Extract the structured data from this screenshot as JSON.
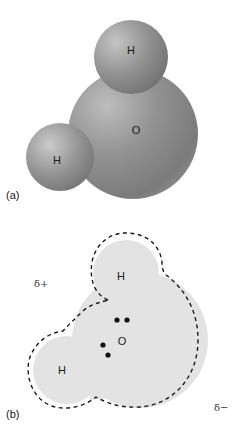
{
  "figure": {
    "panel_a": {
      "label": "(a)",
      "title": "Space-filling model of water molecule",
      "atoms": [
        {
          "symbol": "H",
          "role": "hydrogen-top"
        },
        {
          "symbol": "O",
          "role": "oxygen"
        },
        {
          "symbol": "H",
          "role": "hydrogen-left"
        }
      ]
    },
    "panel_b": {
      "label": "(b)",
      "title": "Electron-cloud / polarity diagram",
      "atoms": [
        {
          "symbol": "H",
          "role": "hydrogen-top"
        },
        {
          "symbol": "O",
          "role": "oxygen"
        },
        {
          "symbol": "H",
          "role": "hydrogen-left"
        }
      ],
      "lone_pairs": 2,
      "partial_positive": "δ+",
      "partial_negative": "δ−"
    },
    "colors": {
      "sphere_base": "#8e8e8e",
      "sphere_highlight": "#c8c8c8",
      "sphere_shadow": "#5a5a5a",
      "cloud_fill": "#e3e3e3",
      "dash_stroke": "#1a1a1a"
    }
  }
}
